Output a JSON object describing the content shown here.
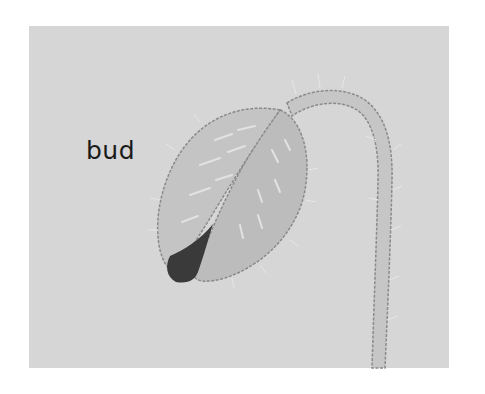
{
  "figure": {
    "label": "bud",
    "colors": {
      "background": "#ffffff",
      "panel": "#d6d6d6",
      "sepal_light": "#c4c4c4",
      "sepal_right": "#bcbcbc",
      "stem": "#c6c6c6",
      "outline": "#8a8a8a",
      "petal_tip": "#3a3a3a",
      "hair": "#ececec",
      "text": "#1a1a1a"
    }
  }
}
